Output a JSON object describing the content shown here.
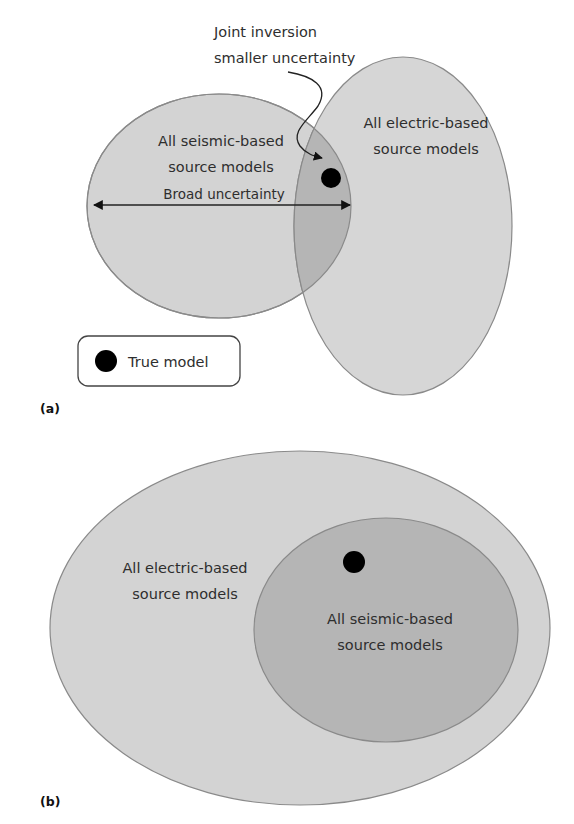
{
  "figure": {
    "panel_a": {
      "label": "(a)",
      "annotation": {
        "line1": "Joint inversion",
        "line2": "smaller uncertainty"
      },
      "seismic_region": {
        "line1": "All seismic-based",
        "line2": "source models"
      },
      "electric_region": {
        "line1": "All electric-based",
        "line2": "source models"
      },
      "range_arrow_label": "Broad uncertainty",
      "legend": {
        "marker": "filled-black-circle",
        "label": "True model"
      }
    },
    "panel_b": {
      "label": "(b)",
      "electric_region": {
        "line1": "All electric-based",
        "line2": "source models"
      },
      "seismic_region": {
        "line1": "All seismic-based",
        "line2": "source models"
      }
    },
    "colors": {
      "light_fill": "#d3d3d3",
      "overlap_fill": "#b5b5b5",
      "outline": "#8a8a8a",
      "text": "#2e2e2e",
      "true_model": "#000000"
    }
  }
}
